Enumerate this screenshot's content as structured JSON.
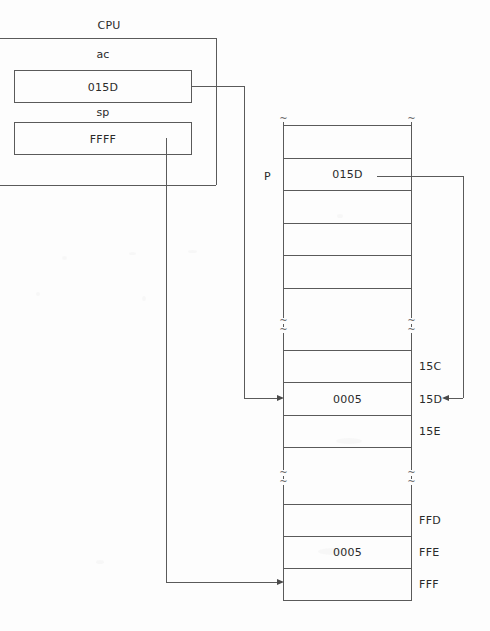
{
  "diagram": {
    "title_label": "CPU",
    "cpu": {
      "registers": [
        {
          "name_label": "ac",
          "value": "015D"
        },
        {
          "name_label": "sp",
          "value": "FFFF"
        }
      ]
    },
    "memory": {
      "pointer_label": "P",
      "cells": [
        {
          "address": "",
          "value": ""
        },
        {
          "address": "",
          "value": "015D"
        },
        {
          "address": "",
          "value": ""
        },
        {
          "address": "",
          "value": ""
        },
        {
          "address": "",
          "value": ""
        },
        {
          "address": "15C",
          "value": ""
        },
        {
          "address": "15D",
          "value": "0005"
        },
        {
          "address": "15E",
          "value": ""
        },
        {
          "address": "",
          "value": ""
        },
        {
          "address": "FFD",
          "value": ""
        },
        {
          "address": "FFE",
          "value": "0005"
        },
        {
          "address": "FFF",
          "value": ""
        }
      ],
      "break_mark": "~"
    }
  },
  "colors": {
    "line": "#5a5a5a",
    "text": "#2a2a2a",
    "background": "#fdfdfd"
  }
}
